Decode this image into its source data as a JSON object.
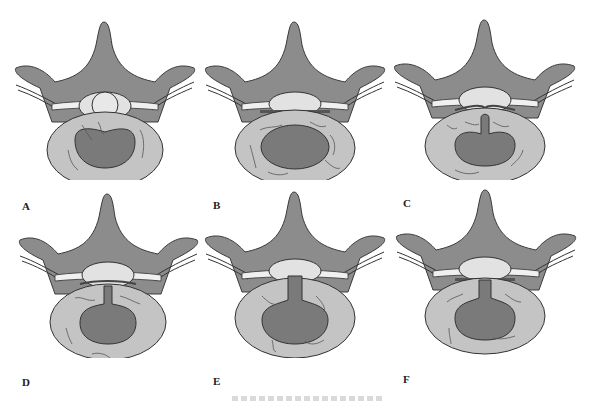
{
  "figure": {
    "type": "multi-panel anatomical diagram",
    "colors": {
      "bone": "#8c8c8c",
      "bone_outline": "#3a3a3a",
      "disc_annulus": "#c4c4c4",
      "nucleus": "#7a7a7a",
      "canal_dura": "#e2e2e2",
      "nerve": "#f0f0f0",
      "fissure_lines": "#555555",
      "background": "#ffffff"
    },
    "panels": [
      {
        "label": "A",
        "state": "normal disc, intact nucleus, fissures in annulus"
      },
      {
        "label": "B",
        "state": "annular fissures, nucleus contained"
      },
      {
        "label": "C",
        "state": "nucleus protruding into posterior annular tear"
      },
      {
        "label": "D",
        "state": "nucleus extending through posterior annulus to canal"
      },
      {
        "label": "E",
        "state": "nucleus extruded through annulus contacting dura"
      },
      {
        "label": "F",
        "state": "nucleus extruded through annulus, canal compressed"
      }
    ],
    "caption": {
      "text": "",
      "note": "caption clipped at bottom edge, illegible"
    }
  }
}
